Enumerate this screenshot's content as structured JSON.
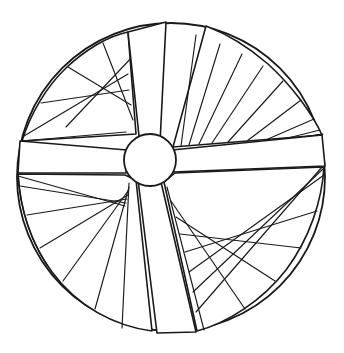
{
  "document": {
    "title": "Circular Wheel Rosette Line Drawing",
    "kind": "line-art-illustration",
    "canvas": {
      "width": 344,
      "height": 353,
      "background": "#ffffff"
    }
  },
  "style": {
    "stroke_color": "#1a1a1a",
    "fill_color": "#ffffff",
    "outer_rim_width": 1.8,
    "spoke_width": 1.6,
    "hatch_width": 1.2,
    "hub_width": 1.8
  },
  "geometry": {
    "outer_circle": {
      "cx": 171,
      "cy": 177,
      "r": 154
    },
    "hub_circle": {
      "cx": 150,
      "cy": 160,
      "r": 26
    }
  },
  "spokes": [
    {
      "name": "spoke-upper",
      "label": "Upper vertical spoke",
      "points": "140,136 131,32 165,22 160,143"
    },
    {
      "name": "spoke-right",
      "label": "Right horizontal spoke",
      "points": "172,150 323,137 325,165 173,171"
    },
    {
      "name": "spoke-lower",
      "label": "Lower vertical spoke",
      "points": "160,182 194,334 158,333 139,180"
    },
    {
      "name": "spoke-left",
      "label": "Left horizontal spoke",
      "points": "126,150 20,142 18,172 125,172"
    }
  ],
  "sectors": [
    {
      "name": "sector-top-left",
      "label": "Top-left sector with fan diagonals",
      "hatch_style": "converging-diagonals",
      "hatch_count": 6,
      "outline": "136,134 128,32 100,43 66,68 39,105 22,141 124,148"
    },
    {
      "name": "sector-top-right",
      "label": "Top-right sector with radial ribs",
      "hatch_style": "radial-ribs",
      "hatch_count": 10,
      "outline": "173,147 322,135 300,95 268,62 228,38 173,144"
    },
    {
      "name": "sector-bottom-right",
      "label": "Bottom-right sector with parallel diagonals",
      "hatch_style": "parallel-diagonals",
      "hatch_count": 8,
      "outline": "175,173 324,167 313,222 286,272 243,310 197,331 164,182"
    },
    {
      "name": "sector-bottom-left",
      "label": "Bottom-left sector with radial ribs and open field",
      "hatch_style": "radial-ribs",
      "hatch_count": 7,
      "outline": "125,175 18,174 25,220 50,268 90,306 137,328 156,331 136,180"
    }
  ],
  "hatch_lines": {
    "top_left_fan": [
      "132,120 103,43",
      "130,104 67,67",
      "128,88 40,104",
      "127,72 23,140",
      "134,53 68,126",
      "132,133 22,141"
    ],
    "top_right_ribs": [
      "178,144 190,40",
      "186,142 214,44",
      "196,140 236,50",
      "209,139 258,62",
      "226,138 280,78",
      "246,136 300,97",
      "268,135 318,123",
      "288,135 322,134",
      "303,134 323,134",
      "314,134 324,134"
    ],
    "bottom_right_diagonals": [
      "167,186 203,330",
      "172,200 243,311",
      "177,216 272,284",
      "181,234 299,252",
      "186,252 316,215",
      "190,272 324,178",
      "194,292 324,168",
      "197,312 322,166"
    ],
    "bottom_left_ribs": [
      "128,183 124,330",
      "129,186 96,310",
      "129,190 64,280",
      "128,194 41,248",
      "127,198 27,214",
      "126,202 19,182",
      "125,205 18,175"
    ]
  },
  "annotations": {
    "hub_label": "central-hub",
    "rim_label": "outer-rim"
  }
}
